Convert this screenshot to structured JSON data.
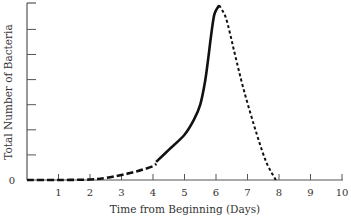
{
  "chart_data": {
    "type": "line",
    "title": "",
    "xlabel": "Time from Beginning (Days)",
    "ylabel": "Total Number of Bacteria",
    "xlim": [
      0,
      10
    ],
    "ylim": [
      0,
      7
    ],
    "x_ticks": [
      1,
      2,
      3,
      4,
      5,
      6,
      7,
      8,
      9,
      10
    ],
    "y_ticks": [
      1,
      2,
      3,
      4,
      5,
      6,
      7
    ],
    "y_tick_labels": [
      "0"
    ],
    "grid": false,
    "legend": null,
    "series": [
      {
        "name": "Lag / early growth (dashed)",
        "style": "dashed",
        "x": [
          0,
          1,
          2,
          2.5,
          3,
          3.5,
          4,
          4.1
        ],
        "y": [
          0,
          0,
          0.02,
          0.08,
          0.2,
          0.35,
          0.55,
          0.65
        ]
      },
      {
        "name": "Exponential growth (solid)",
        "style": "solid",
        "x": [
          4.1,
          4.5,
          5,
          5.3,
          5.5,
          5.65,
          5.75,
          5.85,
          5.95,
          6.1
        ],
        "y": [
          0.72,
          1.2,
          1.8,
          2.4,
          3.0,
          3.9,
          4.8,
          5.8,
          6.6,
          6.95
        ]
      },
      {
        "name": "Decline (dotted)",
        "style": "dotted",
        "x": [
          6.1,
          6.3,
          6.45,
          6.6,
          6.9,
          7.3,
          7.6,
          7.9
        ],
        "y": [
          6.95,
          6.5,
          5.8,
          5.0,
          3.5,
          1.8,
          0.7,
          0
        ]
      }
    ],
    "annotations": []
  },
  "axes": {
    "x_title": "Time from Beginning (Days)",
    "y_title": "Total Number of Bacteria",
    "zero_label": "0",
    "x_tick_labels": [
      "1",
      "2",
      "3",
      "4",
      "5",
      "6",
      "7",
      "8",
      "9",
      "10"
    ]
  },
  "colors": {
    "curve": "#111111",
    "axis": "#555555",
    "text": "#333333"
  }
}
